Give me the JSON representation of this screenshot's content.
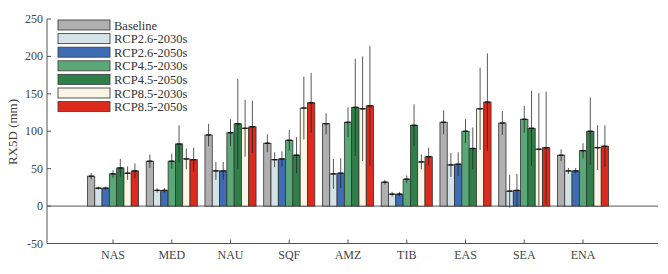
{
  "chart_data": {
    "type": "bar",
    "title": "",
    "xlabel": "",
    "ylabel": "RX5D (mm)",
    "ylim": [
      -50,
      250
    ],
    "yticks": [
      -50,
      0,
      50,
      100,
      150,
      200,
      250
    ],
    "grid": false,
    "legend_position": "upper-left",
    "categories": [
      "NAS",
      "MED",
      "NAU",
      "SQF",
      "AMZ",
      "TIB",
      "EAS",
      "SEA",
      "ENA"
    ],
    "series": [
      {
        "name": "Baseline",
        "color": "#b0b0b0",
        "values": [
          40,
          60,
          95,
          84,
          110,
          32,
          112,
          111,
          68
        ],
        "errors": [
          4,
          9,
          15,
          12,
          14,
          3,
          16,
          16,
          8
        ]
      },
      {
        "name": "RCP2.6-2030s",
        "color": "#d4e4e6",
        "values": [
          24,
          21,
          47,
          62,
          43,
          16,
          55,
          20,
          47
        ],
        "errors": [
          2,
          3,
          12,
          10,
          20,
          3,
          16,
          22,
          4
        ]
      },
      {
        "name": "RCP2.6-2050s",
        "color": "#3e6db5",
        "values": [
          24,
          21,
          47,
          63,
          44,
          16,
          56,
          21,
          47
        ],
        "errors": [
          2,
          3,
          12,
          10,
          20,
          3,
          16,
          22,
          4
        ]
      },
      {
        "name": "RCP4.5-2030s",
        "color": "#5aa878",
        "values": [
          43,
          60,
          98,
          88,
          112,
          36,
          100,
          116,
          74
        ],
        "errors": [
          5,
          10,
          18,
          14,
          20,
          5,
          16,
          18,
          10
        ]
      },
      {
        "name": "RCP4.5-2050s",
        "color": "#2e8048",
        "values": [
          51,
          83,
          110,
          68,
          132,
          108,
          77,
          104,
          100
        ],
        "errors": [
          12,
          25,
          60,
          24,
          65,
          28,
          28,
          50,
          45
        ]
      },
      {
        "name": "RCP8.5-2030s",
        "color": "#fbf5e6",
        "values": [
          44,
          63,
          104,
          131,
          130,
          59,
          130,
          76,
          78
        ],
        "errors": [
          9,
          14,
          38,
          42,
          70,
          10,
          55,
          75,
          30
        ]
      },
      {
        "name": "RCP8.5-2050s",
        "color": "#dd2a1c",
        "values": [
          47,
          62,
          106,
          138,
          134,
          66,
          139,
          78,
          80
        ],
        "errors": [
          10,
          16,
          35,
          40,
          80,
          12,
          65,
          75,
          28
        ]
      }
    ]
  }
}
